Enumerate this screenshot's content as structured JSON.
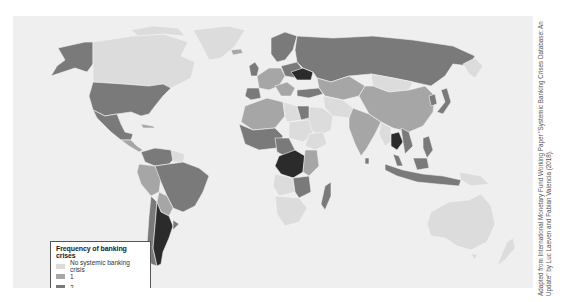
{
  "figure": {
    "type": "choropleth-world-map",
    "background_color": "#efefef"
  },
  "legend": {
    "title": "Frequency of banking crises",
    "items": [
      {
        "label": "No systemic banking crisis",
        "color": "#dcdcdc"
      },
      {
        "label": "1",
        "color": "#a6a6a6"
      },
      {
        "label": "2",
        "color": "#7a7a7a"
      },
      {
        "label": "3–4",
        "color": "#2b2b2b"
      }
    ]
  },
  "attribution": "Adapted from International Monetary Fund Working Paper \"Systemic Banking Crises Database: An Update\" by Luc Laeven and Fabian Valencia (2018).",
  "regions": [
    {
      "name": "Canada",
      "category": "No systemic banking crisis"
    },
    {
      "name": "Greenland",
      "category": "No systemic banking crisis"
    },
    {
      "name": "Alaska / United States",
      "category": "2"
    },
    {
      "name": "Mexico",
      "category": "2"
    },
    {
      "name": "Brazil",
      "category": "2"
    },
    {
      "name": "Argentina",
      "category": "3–4"
    },
    {
      "name": "Russia",
      "category": "2"
    },
    {
      "name": "Ukraine",
      "category": "3–4"
    },
    {
      "name": "China",
      "category": "1"
    },
    {
      "name": "India",
      "category": "1"
    },
    {
      "name": "Thailand",
      "category": "2"
    },
    {
      "name": "Democratic Republic of the Congo",
      "category": "3–4"
    },
    {
      "name": "Australia",
      "category": "No systemic banking crisis"
    },
    {
      "name": "Madagascar",
      "category": "1"
    }
  ]
}
